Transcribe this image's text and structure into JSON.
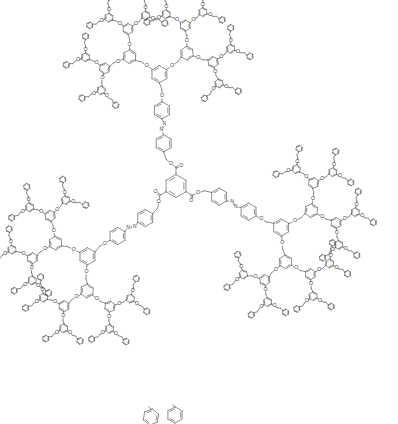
{
  "figure": {
    "kind": "chemical-structure-diagram",
    "title": "",
    "caption": "",
    "background_color": "#ffffff",
    "line_color": "#4a4a4a",
    "line_width": 0.62,
    "width": 398,
    "height": 424
  },
  "molecule": {
    "class": "Frechet-type poly(benzyl ether) dendrimer",
    "symmetry": "C3",
    "core": {
      "name": "benzene-1,3,5-tricarboxylate",
      "common_name": "trimesate core",
      "arms": 3,
      "center_x": 176,
      "center_y": 186,
      "ring_radius": 11.5,
      "substituent": "ester-carbonyl"
    },
    "spacer": {
      "name": "azobenzene",
      "linkage": "-C(=O)O-CH2-C6H4-N=N-C6H4-O-",
      "azo_group": "N=N",
      "count": 3
    },
    "dendron": {
      "name": "3,5-dioxybenzyl dendron",
      "branch_multiplicity": 2,
      "generations": 4,
      "branch_ring_radius": 8.6,
      "terminal_group": "benzyl",
      "terminal_ring_radius": 8.2,
      "ether_linkage": "O"
    },
    "arm_directions_deg": [
      -90,
      30,
      150
    ]
  },
  "labels": {
    "oxygen": "O",
    "nitrogen": "N"
  },
  "bottom_fragment": {
    "visible": true,
    "description": "clipped terminal phenyl rings at lower image edge",
    "ring_count": 2
  }
}
